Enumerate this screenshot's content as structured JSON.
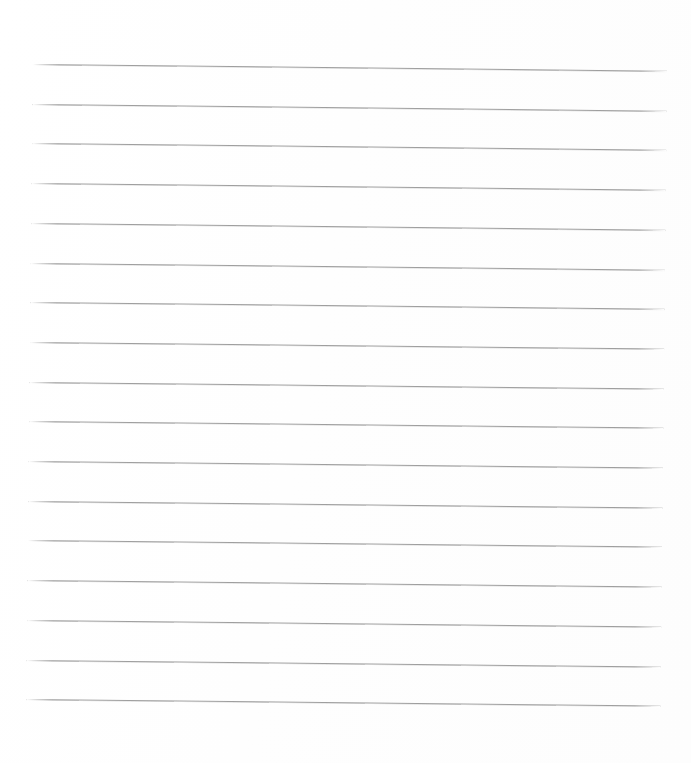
{
  "document": {
    "kind": "blank-lined-paper",
    "description": "Blank ruled writing paper, scanned",
    "width": 691,
    "height": 763,
    "text_content": "",
    "has_text": false,
    "has_handwriting": false,
    "has_margin_rule": false,
    "has_holes": false,
    "has_header": false
  },
  "paper": {
    "background_color": "#fefefe",
    "page_color": "#ffffff"
  },
  "ruling": {
    "line_color": "#9e9e9e",
    "line_thickness_px": 1,
    "line_count": 17,
    "line_spacing_px": 39.7,
    "line_left_x": 33,
    "line_right_x": 667,
    "line_length_px": 634,
    "first_line_y": 64,
    "last_line_y": 699,
    "skew_degrees": 0.6,
    "skew_drop_px": 7,
    "lines": [
      {
        "index": 1,
        "y": 64.0,
        "label": "rule-1"
      },
      {
        "index": 2,
        "y": 103.7,
        "label": "rule-2"
      },
      {
        "index": 3,
        "y": 143.4,
        "label": "rule-3"
      },
      {
        "index": 4,
        "y": 183.1,
        "label": "rule-4"
      },
      {
        "index": 5,
        "y": 222.8,
        "label": "rule-5"
      },
      {
        "index": 6,
        "y": 262.5,
        "label": "rule-6"
      },
      {
        "index": 7,
        "y": 302.2,
        "label": "rule-7"
      },
      {
        "index": 8,
        "y": 341.9,
        "label": "rule-8"
      },
      {
        "index": 9,
        "y": 381.6,
        "label": "rule-9"
      },
      {
        "index": 10,
        "y": 421.3,
        "label": "rule-10"
      },
      {
        "index": 11,
        "y": 461.0,
        "label": "rule-11"
      },
      {
        "index": 12,
        "y": 500.7,
        "label": "rule-12"
      },
      {
        "index": 13,
        "y": 540.4,
        "label": "rule-13"
      },
      {
        "index": 14,
        "y": 580.1,
        "label": "rule-14"
      },
      {
        "index": 15,
        "y": 619.8,
        "label": "rule-15"
      },
      {
        "index": 16,
        "y": 659.5,
        "label": "rule-16"
      },
      {
        "index": 17,
        "y": 699.2,
        "label": "rule-17"
      }
    ]
  },
  "margins": {
    "top_px": 64,
    "bottom_px": 64,
    "left_px": 33,
    "right_px": 24
  }
}
